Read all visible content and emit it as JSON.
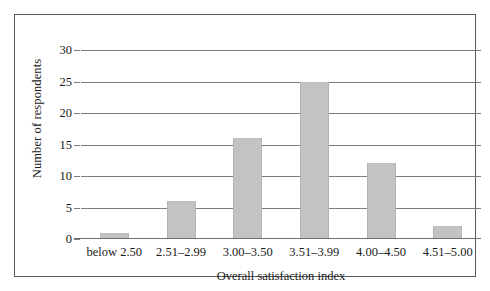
{
  "chart_data": {
    "type": "bar",
    "title": "",
    "xlabel": "Overall satisfaction index",
    "ylabel": "Number of respondents",
    "categories": [
      "below 2.50",
      "2.51–2.99",
      "3.00–3.50",
      "3.51–3.99",
      "4.00–4.50",
      "4.51–5.00"
    ],
    "values": [
      1,
      6,
      16,
      25,
      12,
      2
    ],
    "ylim": [
      0,
      30
    ],
    "yticks": [
      0,
      5,
      10,
      15,
      20,
      25,
      30
    ],
    "ytick_labels": [
      "0",
      "5",
      "10",
      "15",
      "20",
      "25",
      "30"
    ],
    "grid": "horizontal",
    "legend": "none",
    "bar_color": "#c3c3c3",
    "grid_color": "#7c7c7c",
    "axis_color": "#6e6e6e",
    "frame_color": "#5a5a5a",
    "background": "#ffffff"
  }
}
